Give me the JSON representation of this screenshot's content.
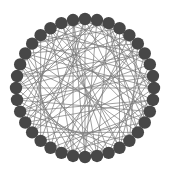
{
  "diagram": {
    "type": "circular-network-graph",
    "center": [
      85,
      88
    ],
    "radius": 69,
    "node_count": 36,
    "node_radius": 6.2,
    "colors": {
      "background": "#ffffff",
      "node_fill": "#474747",
      "edge_stroke": "#7a7a7a"
    },
    "edges": [
      [
        0,
        7
      ],
      [
        0,
        13
      ],
      [
        0,
        22
      ],
      [
        0,
        29
      ],
      [
        1,
        9
      ],
      [
        1,
        18
      ],
      [
        1,
        26
      ],
      [
        1,
        33
      ],
      [
        2,
        11
      ],
      [
        2,
        17
      ],
      [
        2,
        24
      ],
      [
        2,
        31
      ],
      [
        3,
        10
      ],
      [
        3,
        20
      ],
      [
        3,
        27
      ],
      [
        3,
        35
      ],
      [
        4,
        12
      ],
      [
        4,
        19
      ],
      [
        4,
        28
      ],
      [
        5,
        14
      ],
      [
        5,
        21
      ],
      [
        5,
        30
      ],
      [
        5,
        34
      ],
      [
        6,
        15
      ],
      [
        6,
        23
      ],
      [
        6,
        32
      ],
      [
        7,
        16
      ],
      [
        7,
        25
      ],
      [
        7,
        33
      ],
      [
        8,
        17
      ],
      [
        8,
        22
      ],
      [
        8,
        28
      ],
      [
        9,
        20
      ],
      [
        9,
        27
      ],
      [
        9,
        35
      ],
      [
        10,
        19
      ],
      [
        10,
        24
      ],
      [
        10,
        31
      ],
      [
        11,
        21
      ],
      [
        11,
        26
      ],
      [
        11,
        34
      ],
      [
        12,
        22
      ],
      [
        12,
        29
      ],
      [
        13,
        23
      ],
      [
        13,
        30
      ],
      [
        14,
        24
      ],
      [
        14,
        32
      ],
      [
        15,
        25
      ],
      [
        15,
        33
      ],
      [
        16,
        26
      ],
      [
        16,
        34
      ],
      [
        17,
        27
      ],
      [
        18,
        28
      ],
      [
        18,
        35
      ],
      [
        19,
        29
      ],
      [
        20,
        30
      ],
      [
        21,
        31
      ],
      [
        22,
        32
      ],
      [
        23,
        33
      ],
      [
        24,
        34
      ],
      [
        25,
        35
      ],
      [
        0,
        18
      ],
      [
        3,
        15
      ],
      [
        6,
        27
      ],
      [
        9,
        30
      ],
      [
        12,
        33
      ],
      [
        4,
        24
      ],
      [
        8,
        31
      ],
      [
        14,
        2
      ],
      [
        20,
        5
      ],
      [
        26,
        8
      ],
      [
        32,
        11
      ],
      [
        1,
        12
      ],
      [
        16,
        29
      ],
      [
        19,
        35
      ],
      [
        23,
        4
      ],
      [
        13,
        2
      ],
      [
        21,
        0
      ],
      [
        25,
        10
      ],
      [
        28,
        6
      ],
      [
        30,
        17
      ],
      [
        34,
        15
      ],
      [
        0,
        4
      ],
      [
        3,
        6
      ],
      [
        7,
        10
      ],
      [
        11,
        14
      ],
      [
        15,
        19
      ],
      [
        18,
        22
      ],
      [
        26,
        30
      ],
      [
        29,
        32
      ],
      [
        1,
        23
      ],
      [
        5,
        25
      ],
      [
        9,
        14
      ],
      [
        17,
        35
      ],
      [
        20,
        13
      ],
      [
        27,
        1
      ],
      [
        31,
        3
      ],
      [
        33,
        19
      ]
    ]
  }
}
